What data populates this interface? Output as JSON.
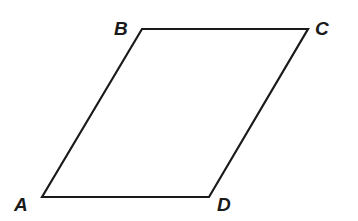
{
  "figure": {
    "type": "parallelogram",
    "stroke_color": "#1a1a1a",
    "background": "#ffffff",
    "vertices": [
      {
        "name": "A",
        "x": 42,
        "y": 197,
        "label": "A",
        "label_x": 14,
        "label_y": 211
      },
      {
        "name": "B",
        "x": 142,
        "y": 29,
        "label": "B",
        "label_x": 114,
        "label_y": 35
      },
      {
        "name": "C",
        "x": 308,
        "y": 29,
        "label": "C",
        "label_x": 315,
        "label_y": 35
      },
      {
        "name": "D",
        "x": 209,
        "y": 197,
        "label": "D",
        "label_x": 217,
        "label_y": 211
      }
    ],
    "edges": [
      [
        "A",
        "B"
      ],
      [
        "B",
        "C"
      ],
      [
        "C",
        "D"
      ],
      [
        "D",
        "A"
      ]
    ]
  }
}
